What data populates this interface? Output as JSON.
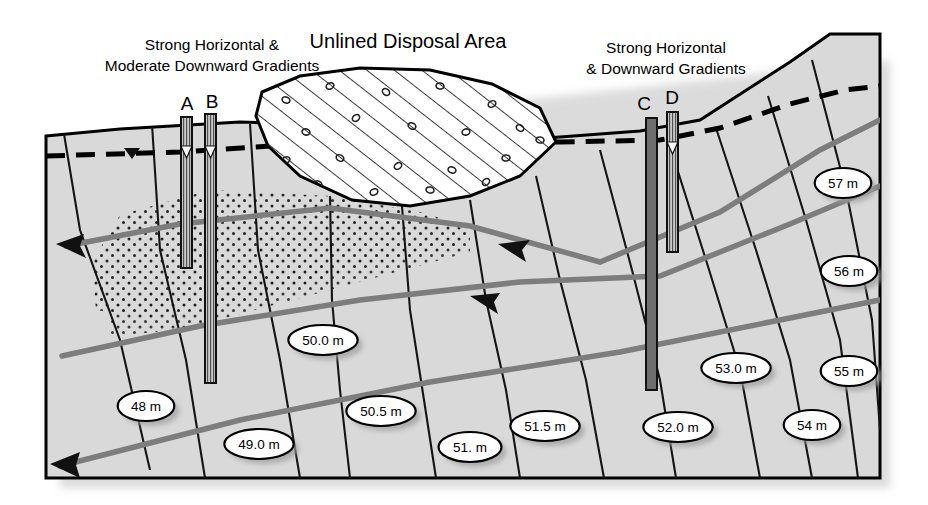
{
  "figure": {
    "type": "hydrogeologic-cross-section",
    "title_center": "Unlined Disposal Area",
    "label_left_line1": "Strong Horizontal &",
    "label_left_line2": "Moderate Downward Gradients",
    "label_right_line1": "Strong Horizontal",
    "label_right_line2": "& Downward Gradients",
    "colors": {
      "ground_fill": "#d9d9d9",
      "outline": "#000000",
      "flowline": "#7d7d7d",
      "equipotential": "#1a1a1a",
      "well_casing": "#6e6e6e",
      "callout_fill": "#ffffff",
      "shadow": "#b4b4b4"
    }
  },
  "wells": [
    {
      "id": "A",
      "label_x": 187,
      "label_y": 110,
      "top_x": 187,
      "top_y": 117,
      "bottom_y": 268,
      "water_y": 152,
      "has_water_marker": true,
      "shade": "hatch"
    },
    {
      "id": "B",
      "label_x": 212,
      "label_y": 108,
      "top_x": 210,
      "top_y": 114,
      "bottom_y": 383,
      "water_y": 152,
      "has_water_marker": true,
      "shade": "hatch"
    },
    {
      "id": "C",
      "label_x": 644,
      "label_y": 110,
      "top_x": 651,
      "top_y": 118,
      "bottom_y": 390,
      "water_y": 0,
      "has_water_marker": false,
      "shade": "dark"
    },
    {
      "id": "D",
      "label_x": 672,
      "label_y": 104,
      "top_x": 672,
      "top_y": 112,
      "bottom_y": 252,
      "water_y": 148,
      "has_water_marker": true,
      "shade": "hatch"
    }
  ],
  "contour_labels": [
    {
      "text": "57 m",
      "x": 843,
      "y": 183
    },
    {
      "text": "56 m",
      "x": 849,
      "y": 271
    },
    {
      "text": "55 m",
      "x": 849,
      "y": 371
    },
    {
      "text": "54 m",
      "x": 812,
      "y": 425
    },
    {
      "text": "53.0 m",
      "x": 736,
      "y": 368
    },
    {
      "text": "52.0 m",
      "x": 678,
      "y": 427
    },
    {
      "text": "51.5 m",
      "x": 545,
      "y": 426
    },
    {
      "text": "51. m",
      "x": 470,
      "y": 447
    },
    {
      "text": "50.5 m",
      "x": 381,
      "y": 411
    },
    {
      "text": "50.0 m",
      "x": 323,
      "y": 340
    },
    {
      "text": "49.0 m",
      "x": 259,
      "y": 444
    },
    {
      "text": "48 m",
      "x": 146,
      "y": 406
    }
  ],
  "legend_semantics": {
    "water_table": "dashed-line",
    "flow_direction": "arrow",
    "disposal_fill": "diagonal-hatch-with-debris",
    "plume_fill": "stipple-dots"
  }
}
